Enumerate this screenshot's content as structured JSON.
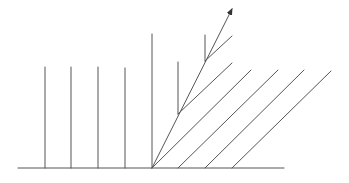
{
  "diagram": {
    "title": "",
    "colors": {
      "line": "#555555",
      "background": "#ffffff"
    },
    "baseline": {
      "x1": 18,
      "y1": 168,
      "x2": 284,
      "y2": 168
    },
    "left_verticals": [
      {
        "x": 45,
        "y1": 67,
        "y2": 168
      },
      {
        "x": 71,
        "y1": 67,
        "y2": 168
      },
      {
        "x": 98,
        "y1": 67,
        "y2": 168
      },
      {
        "x": 125,
        "y1": 68,
        "y2": 168
      }
    ],
    "tall_vertical": {
      "x": 152,
      "y1": 34,
      "y2": 168
    },
    "arrow": {
      "x1": 152,
      "y1": 168,
      "x2": 232,
      "y2": 9,
      "head": "arrow-head"
    },
    "short_verticals": [
      {
        "x": 178,
        "y1": 62,
        "y2": 114
      },
      {
        "x": 205,
        "y1": 35,
        "y2": 61
      }
    ],
    "branch_lines": [
      {
        "x1": 178,
        "y1": 114,
        "x2": 232,
        "y2": 63
      },
      {
        "x1": 205,
        "y1": 61,
        "x2": 232,
        "y2": 36
      }
    ],
    "diagonals": [
      {
        "x1": 152,
        "y1": 168,
        "x2": 251,
        "y2": 70
      },
      {
        "x1": 178,
        "y1": 168,
        "x2": 278,
        "y2": 70
      },
      {
        "x1": 205,
        "y1": 168,
        "x2": 304,
        "y2": 70
      },
      {
        "x1": 232,
        "y1": 168,
        "x2": 331,
        "y2": 71
      }
    ]
  }
}
